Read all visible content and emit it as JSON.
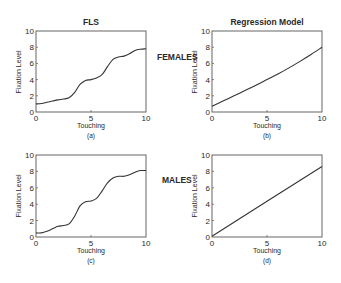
{
  "figure": {
    "group_labels": {
      "females": "FEMALES",
      "males": "MALES"
    },
    "column_titles": {
      "left": "FLS",
      "right": "Regression Model"
    }
  },
  "chart_data": [
    {
      "id": "a",
      "type": "line",
      "title": "FLS",
      "group": "FEMALES",
      "caption": "(a)",
      "xlabel": "Touching",
      "ylabel": "Fixation Level",
      "xlim": [
        0,
        10
      ],
      "ylim": [
        0,
        10
      ],
      "xticks": [
        "0",
        "5",
        "10"
      ],
      "yticks": [
        "0",
        "2",
        "4",
        "6",
        "8",
        "10"
      ],
      "grid": false,
      "x": [
        0,
        0.5,
        1,
        1.5,
        2,
        2.5,
        3,
        3.5,
        4,
        4.5,
        5,
        5.5,
        6,
        6.5,
        7,
        7.5,
        8,
        8.5,
        9,
        9.5,
        10
      ],
      "values": [
        1.0,
        1.05,
        1.2,
        1.35,
        1.5,
        1.6,
        1.75,
        2.4,
        3.4,
        3.9,
        4.0,
        4.2,
        4.6,
        5.6,
        6.5,
        6.8,
        6.9,
        7.2,
        7.6,
        7.75,
        7.8
      ]
    },
    {
      "id": "b",
      "type": "line",
      "title": "Regression Model",
      "group": "FEMALES",
      "caption": "(b)",
      "xlabel": "Touching",
      "ylabel": "Fixation Level",
      "xlim": [
        0,
        10
      ],
      "ylim": [
        0,
        10
      ],
      "xticks": [
        "0",
        "5",
        "10"
      ],
      "yticks": [
        "0",
        "2",
        "4",
        "6",
        "8",
        "10"
      ],
      "grid": false,
      "x": [
        0,
        1,
        2,
        3,
        4,
        5,
        6,
        7,
        8,
        9,
        10
      ],
      "values": [
        0.7,
        1.35,
        2.0,
        2.65,
        3.3,
        4.0,
        4.7,
        5.45,
        6.25,
        7.1,
        8.0
      ]
    },
    {
      "id": "c",
      "type": "line",
      "title": "",
      "group": "MALES",
      "caption": "(c)",
      "xlabel": "Touching",
      "ylabel": "Fixation Level",
      "xlim": [
        0,
        10
      ],
      "ylim": [
        0,
        10
      ],
      "xticks": [
        "0",
        "5",
        "10"
      ],
      "yticks": [
        "0",
        "2",
        "4",
        "6",
        "8",
        "10"
      ],
      "grid": false,
      "x": [
        0,
        0.5,
        1,
        1.5,
        2,
        2.5,
        3,
        3.5,
        4,
        4.5,
        5,
        5.5,
        6,
        6.5,
        7,
        7.5,
        8,
        8.5,
        9,
        9.5,
        10
      ],
      "values": [
        0.5,
        0.5,
        0.7,
        1.0,
        1.3,
        1.4,
        1.6,
        2.5,
        3.8,
        4.3,
        4.4,
        4.7,
        5.6,
        6.6,
        7.2,
        7.4,
        7.4,
        7.6,
        7.9,
        8.1,
        8.1
      ]
    },
    {
      "id": "d",
      "type": "line",
      "title": "",
      "group": "MALES",
      "caption": "(d)",
      "xlabel": "Touching",
      "ylabel": "Fixation Level",
      "xlim": [
        0,
        10
      ],
      "ylim": [
        0,
        10
      ],
      "xticks": [
        "0",
        "5",
        "10"
      ],
      "yticks": [
        "0",
        "2",
        "4",
        "6",
        "8",
        "10"
      ],
      "grid": false,
      "x": [
        0,
        10
      ],
      "values": [
        0.1,
        8.6
      ]
    }
  ]
}
